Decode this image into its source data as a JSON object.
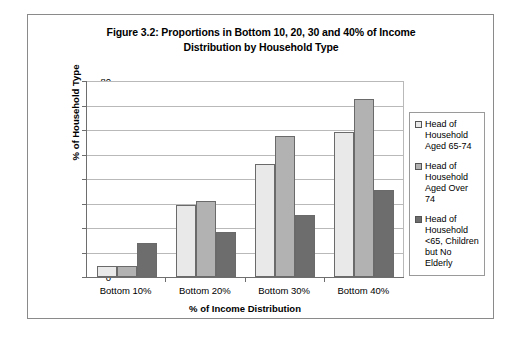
{
  "chart_data": {
    "type": "bar",
    "title": "Figure 3.2: Proportions in Bottom 10, 20, 30 and 40% of Income Distribution by Household Type",
    "title_lines": [
      "Figure 3.2: Proportions in Bottom 10, 20, 30 and 40% of Income",
      "Distribution by Household Type"
    ],
    "xlabel": "% of Income Distribution",
    "ylabel": "% of Household Type",
    "categories": [
      "Bottom 10%",
      "Bottom 20%",
      "Bottom 30%",
      "Bottom 40%"
    ],
    "ylim": [
      0,
      80
    ],
    "ytick_labels": [
      "0",
      "10",
      "20",
      "30",
      "40",
      "50",
      "60",
      "70",
      "80"
    ],
    "ytick_values": [
      0,
      10,
      20,
      30,
      40,
      50,
      60,
      70,
      80
    ],
    "grid": true,
    "legend_position": "right",
    "series": [
      {
        "name": "Head of Household Aged 65-74",
        "name_lines": [
          "Head of",
          "Household",
          "Aged 65-74"
        ],
        "color": "#e9e9e9",
        "values": [
          4.7,
          29.5,
          46.0,
          59.0
        ]
      },
      {
        "name": "Head of Household Aged Over 74",
        "name_lines": [
          "Head of",
          "Household",
          "Aged Over 74"
        ],
        "color": "#b2b2b2",
        "values": [
          4.7,
          31.0,
          57.5,
          72.5
        ]
      },
      {
        "name": "Head of Household <65, Children but No Elderly",
        "name_lines": [
          "Head of",
          "Household",
          "<65, Children",
          "but No Elderly"
        ],
        "color": "#6d6d6d",
        "values": [
          13.8,
          18.5,
          25.3,
          35.5
        ]
      }
    ]
  }
}
